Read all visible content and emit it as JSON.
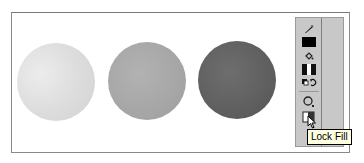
{
  "canvas": {
    "shapes": [
      {
        "name": "light-circle",
        "fill": "#dcdcdc"
      },
      {
        "name": "medium-circle",
        "fill": "#a6a6a6"
      },
      {
        "name": "dark-circle",
        "fill": "#5f5f5f"
      }
    ]
  },
  "toolbar": {
    "tools": [
      {
        "name": "stroke-color",
        "icon": "pencil-icon"
      },
      {
        "name": "stroke-color-swatch",
        "color": "#000000"
      },
      {
        "name": "fill-color",
        "icon": "paint-bucket-icon"
      },
      {
        "name": "fill-color-swatch",
        "icon": "gradient-swatch-icon"
      },
      {
        "name": "swap-colors",
        "icon": "swap-colors-icon"
      },
      {
        "name": "lasso",
        "icon": "lasso-icon"
      },
      {
        "name": "lock-fill",
        "icon": "lock-fill-icon"
      }
    ]
  },
  "tooltip": {
    "text": "Lock Fill"
  }
}
